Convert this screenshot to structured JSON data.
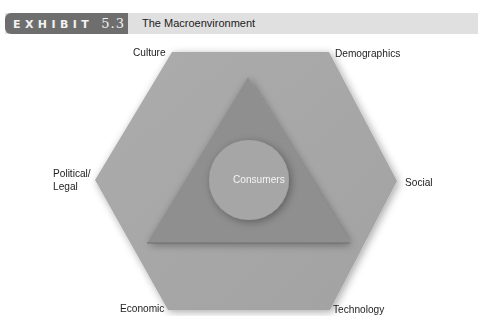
{
  "header": {
    "badge_word": "EXHIBIT",
    "badge_number": "5.3",
    "title": "The Macroenvironment"
  },
  "diagram": {
    "center_label": "Consumers",
    "outer_labels": {
      "top_left": "Culture",
      "top_right": "Demographics",
      "left_line1": "Political/",
      "left_line2": "Legal",
      "right": "Social",
      "bottom_left": "Economic",
      "bottom_right": "Technology"
    },
    "colors": {
      "hexagon": "#a9a9a9",
      "triangle": "#8f8f8f",
      "circle": "#a6a6a6",
      "badge": "#6e6e6e",
      "title_bar": "#e0e0e0"
    }
  }
}
